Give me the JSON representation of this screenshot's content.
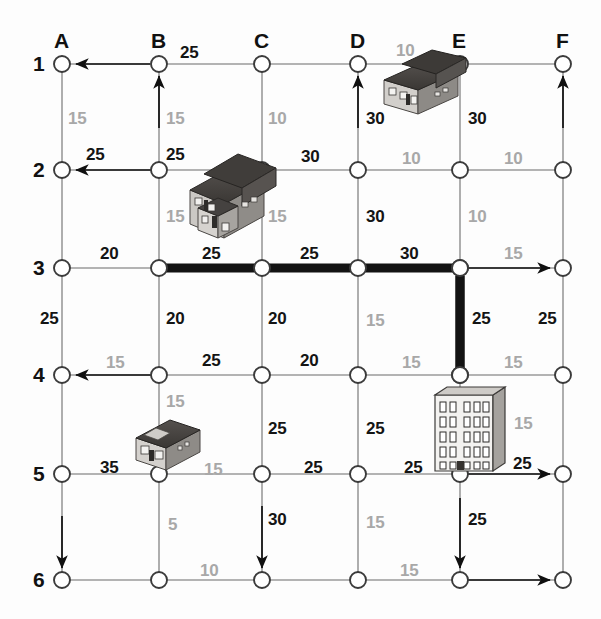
{
  "diagram": {
    "columns": [
      "A",
      "B",
      "C",
      "D",
      "E",
      "F"
    ],
    "rows": [
      "1",
      "2",
      "3",
      "4",
      "5",
      "6"
    ],
    "colors": {
      "dark_label": "#141414",
      "light_label": "#a8a8a8",
      "grid_line": "#9a9a9a",
      "highlight_path": "#1a1a1a",
      "node_fill": "#ffffff"
    },
    "geometry": {
      "col_x": [
        62,
        159,
        262,
        358,
        460,
        563
      ],
      "row_y": [
        64,
        170,
        268,
        375,
        474,
        580
      ],
      "node_radius": 8
    },
    "highlighted_path": {
      "label": "shortest-path",
      "nodes": [
        "B3",
        "C3",
        "D3",
        "E3",
        "E4"
      ],
      "total": "105"
    },
    "horizontal_costs": [
      {
        "row": "1",
        "from": "A",
        "to": "B",
        "value": "25",
        "tone": "dark"
      },
      {
        "row": "2",
        "from": "A",
        "to": "B",
        "value": "25",
        "tone": "dark"
      },
      {
        "row": "2",
        "from": "B",
        "to": "C",
        "value": "25",
        "tone": "dark"
      },
      {
        "row": "2",
        "from": "C",
        "to": "D",
        "value": "30",
        "tone": "dark"
      },
      {
        "row": "2",
        "from": "D",
        "to": "E",
        "value": "10",
        "tone": "light"
      },
      {
        "row": "2",
        "from": "E",
        "to": "F",
        "value": "10",
        "tone": "light"
      },
      {
        "row": "3",
        "from": "A",
        "to": "B",
        "value": "20",
        "tone": "dark"
      },
      {
        "row": "3",
        "from": "B",
        "to": "C",
        "value": "25",
        "tone": "dark"
      },
      {
        "row": "3",
        "from": "C",
        "to": "D",
        "value": "25",
        "tone": "dark"
      },
      {
        "row": "3",
        "from": "D",
        "to": "E",
        "value": "30",
        "tone": "dark"
      },
      {
        "row": "3",
        "from": "E",
        "to": "F",
        "value": "15",
        "tone": "light"
      },
      {
        "row": "4",
        "from": "A",
        "to": "B",
        "value": "15",
        "tone": "light"
      },
      {
        "row": "4",
        "from": "B",
        "to": "C",
        "value": "25",
        "tone": "dark"
      },
      {
        "row": "4",
        "from": "C",
        "to": "D",
        "value": "20",
        "tone": "dark"
      },
      {
        "row": "4",
        "from": "D",
        "to": "E",
        "value": "15",
        "tone": "light"
      },
      {
        "row": "4",
        "from": "E",
        "to": "F",
        "value": "15",
        "tone": "light"
      },
      {
        "row": "5",
        "from": "A",
        "to": "B",
        "value": "35",
        "tone": "dark"
      },
      {
        "row": "5",
        "from": "B",
        "to": "C",
        "value": "15",
        "tone": "light"
      },
      {
        "row": "5",
        "from": "C",
        "to": "D",
        "value": "25",
        "tone": "dark"
      },
      {
        "row": "5",
        "from": "D",
        "to": "E",
        "value": "25",
        "tone": "dark"
      },
      {
        "row": "5",
        "from": "E",
        "to": "F",
        "value": "25",
        "tone": "dark"
      },
      {
        "row": "6",
        "from": "B",
        "to": "C",
        "value": "10",
        "tone": "light"
      },
      {
        "row": "6",
        "from": "D",
        "to": "E",
        "value": "15",
        "tone": "light"
      }
    ],
    "vertical_costs": [
      {
        "col": "A",
        "from": "1",
        "to": "2",
        "value": "15",
        "tone": "light"
      },
      {
        "col": "B",
        "from": "1",
        "to": "2",
        "value": "15",
        "tone": "light"
      },
      {
        "col": "C",
        "from": "1",
        "to": "2",
        "value": "10",
        "tone": "light"
      },
      {
        "col": "D",
        "from": "1",
        "to": "2",
        "value": "30",
        "tone": "dark"
      },
      {
        "col": "E",
        "from": "1",
        "to": "2",
        "value": "30",
        "tone": "dark"
      },
      {
        "col": "D",
        "from": "1",
        "to": "2",
        "value": "10",
        "tone": "light",
        "above": true
      },
      {
        "col": "B",
        "from": "2",
        "to": "3",
        "value": "15",
        "tone": "light"
      },
      {
        "col": "C",
        "from": "2",
        "to": "3",
        "value": "15",
        "tone": "light"
      },
      {
        "col": "D",
        "from": "2",
        "to": "3",
        "value": "30",
        "tone": "dark"
      },
      {
        "col": "E",
        "from": "2",
        "to": "3",
        "value": "10",
        "tone": "light"
      },
      {
        "col": "A",
        "from": "3",
        "to": "4",
        "value": "25",
        "tone": "dark"
      },
      {
        "col": "B",
        "from": "3",
        "to": "4",
        "value": "20",
        "tone": "dark"
      },
      {
        "col": "C",
        "from": "3",
        "to": "4",
        "value": "20",
        "tone": "dark"
      },
      {
        "col": "D",
        "from": "3",
        "to": "4",
        "value": "15",
        "tone": "light"
      },
      {
        "col": "E",
        "from": "3",
        "to": "4",
        "value": "25",
        "tone": "dark"
      },
      {
        "col": "F",
        "from": "3",
        "to": "4",
        "value": "25",
        "tone": "dark"
      },
      {
        "col": "B",
        "from": "4",
        "to": "5",
        "value": "15",
        "tone": "light"
      },
      {
        "col": "C",
        "from": "4",
        "to": "5",
        "value": "25",
        "tone": "dark"
      },
      {
        "col": "D",
        "from": "4",
        "to": "5",
        "value": "25",
        "tone": "dark"
      },
      {
        "col": "E",
        "from": "4",
        "to": "5",
        "value": "15",
        "tone": "light"
      },
      {
        "col": "B",
        "from": "5",
        "to": "6",
        "value": "5",
        "tone": "light"
      },
      {
        "col": "C",
        "from": "5",
        "to": "6",
        "value": "30",
        "tone": "dark"
      },
      {
        "col": "D",
        "from": "5",
        "to": "6",
        "value": "15",
        "tone": "light"
      },
      {
        "col": "E",
        "from": "5",
        "to": "6",
        "value": "25",
        "tone": "dark"
      }
    ],
    "arrows": [
      {
        "name": "arrow-out-A1-left",
        "direction": "left"
      },
      {
        "name": "arrow-into-B1-up",
        "direction": "up"
      },
      {
        "name": "arrow-into-D1-up",
        "direction": "up"
      },
      {
        "name": "arrow-into-F1-up",
        "direction": "up"
      },
      {
        "name": "arrow-out-A2-left",
        "direction": "left"
      },
      {
        "name": "arrow-out-F3-right",
        "direction": "right"
      },
      {
        "name": "arrow-out-A4-left",
        "direction": "left"
      },
      {
        "name": "arrow-out-F5-right",
        "direction": "right"
      },
      {
        "name": "arrow-into-A6-down",
        "direction": "down"
      },
      {
        "name": "arrow-into-C6-down",
        "direction": "down"
      },
      {
        "name": "arrow-into-E6-down",
        "direction": "down"
      },
      {
        "name": "arrow-out-F6-right",
        "direction": "right"
      }
    ],
    "buildings": [
      {
        "name": "house-large-B2",
        "type": "house-large",
        "near": "B2-C2"
      },
      {
        "name": "house-wide-D1",
        "type": "house-wide",
        "near": "D1-E1"
      },
      {
        "name": "house-small-B5",
        "type": "house-small",
        "near": "B4-B5"
      },
      {
        "name": "office-tower-E4",
        "type": "office-tower",
        "near": "E4-E5"
      }
    ]
  }
}
